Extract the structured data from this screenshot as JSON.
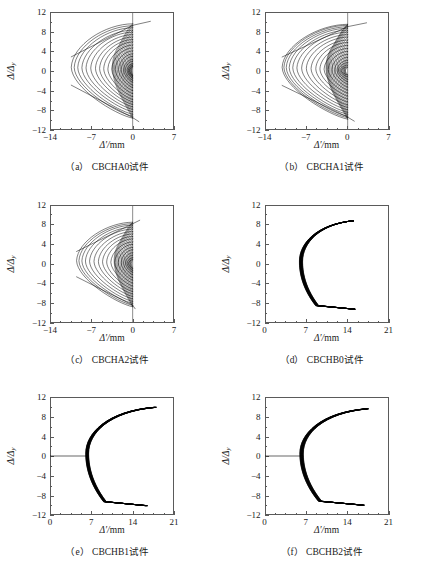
{
  "figure": {
    "background": "#ffffff",
    "axis_color": "#5a5a5a",
    "curve_color": "#000000"
  },
  "chart_data": [
    {
      "id": "a",
      "type": "line",
      "title": "(a) CBCHA0试件",
      "caption_index": "(a)",
      "specimen": "CBCHA0试件",
      "xlabel": "Δ'/mm",
      "ylabel": "Δ/Δy",
      "xlim": [
        -14,
        7
      ],
      "ylim": [
        -12,
        12
      ],
      "xticks": [
        -14,
        -7,
        0,
        7
      ],
      "yticks": [
        12,
        8,
        4,
        0,
        -4,
        -8,
        -12
      ],
      "xminor_count": 3,
      "yminor_count": 1,
      "grid": false,
      "legend": "none",
      "family": "A",
      "direction": "negative",
      "vertex_x": 0.0,
      "loops": [
        {
          "tip_x": -0.55,
          "top_y": 0.9,
          "bot_y": -0.9
        },
        {
          "tip_x": -0.75,
          "top_y": 1.2,
          "bot_y": -1.2
        },
        {
          "tip_x": -0.95,
          "top_y": 1.5,
          "bot_y": -1.5
        },
        {
          "tip_x": -1.25,
          "top_y": 2.0,
          "bot_y": -1.9
        },
        {
          "tip_x": -1.55,
          "top_y": 2.4,
          "bot_y": -2.3
        },
        {
          "tip_x": -1.95,
          "top_y": 3.0,
          "bot_y": -2.9
        },
        {
          "tip_x": -2.4,
          "top_y": 3.5,
          "bot_y": -3.4
        },
        {
          "tip_x": -2.95,
          "top_y": 4.1,
          "bot_y": -4.0
        },
        {
          "tip_x": -3.55,
          "top_y": 4.7,
          "bot_y": -4.6
        },
        {
          "tip_x": -4.2,
          "top_y": 5.3,
          "bot_y": -5.2
        },
        {
          "tip_x": -4.9,
          "top_y": 5.9,
          "bot_y": -5.8
        },
        {
          "tip_x": -5.6,
          "top_y": 6.4,
          "bot_y": -6.3
        },
        {
          "tip_x": -6.3,
          "top_y": 6.9,
          "bot_y": -6.8
        },
        {
          "tip_x": -7.1,
          "top_y": 7.4,
          "bot_y": -7.3
        },
        {
          "tip_x": -7.9,
          "top_y": 7.9,
          "bot_y": -7.8
        },
        {
          "tip_x": -8.6,
          "top_y": 8.3,
          "bot_y": -8.3
        },
        {
          "tip_x": -9.3,
          "top_y": 8.8,
          "bot_y": -8.8
        },
        {
          "tip_x": -9.9,
          "top_y": 9.2,
          "bot_y": -9.2
        },
        {
          "tip_x": -10.4,
          "top_y": 9.6,
          "bot_y": -9.6
        }
      ],
      "overshoot": {
        "x": 3.0,
        "y_top": 10.1,
        "y_bot": -10.3
      }
    },
    {
      "id": "b",
      "type": "line",
      "title": "(b) CBCHA1试件",
      "caption_index": "(b)",
      "specimen": "CBCHA1试件",
      "xlabel": "Δ'/mm",
      "ylabel": "Δ/Δy",
      "xlim": [
        -14,
        7
      ],
      "ylim": [
        -12,
        12
      ],
      "xticks": [
        -14,
        -7,
        0,
        7
      ],
      "yticks": [
        12,
        8,
        4,
        0,
        -4,
        -8,
        -12
      ],
      "xminor_count": 3,
      "yminor_count": 1,
      "grid": false,
      "legend": "none",
      "family": "A",
      "direction": "negative",
      "vertex_x": 0.0,
      "loops": [
        {
          "tip_x": -1.1,
          "top_y": 0.8,
          "bot_y": -0.8
        },
        {
          "tip_x": -1.3,
          "top_y": 1.2,
          "bot_y": -1.2
        },
        {
          "tip_x": -1.55,
          "top_y": 1.7,
          "bot_y": -1.7
        },
        {
          "tip_x": -1.8,
          "top_y": 2.2,
          "bot_y": -2.2
        },
        {
          "tip_x": -2.2,
          "top_y": 2.8,
          "bot_y": -2.7
        },
        {
          "tip_x": -2.7,
          "top_y": 3.4,
          "bot_y": -3.3
        },
        {
          "tip_x": -3.3,
          "top_y": 4.0,
          "bot_y": -3.9
        },
        {
          "tip_x": -4.0,
          "top_y": 4.6,
          "bot_y": -4.5
        },
        {
          "tip_x": -4.7,
          "top_y": 5.2,
          "bot_y": -5.1
        },
        {
          "tip_x": -5.4,
          "top_y": 5.8,
          "bot_y": -5.7
        },
        {
          "tip_x": -6.2,
          "top_y": 6.3,
          "bot_y": -6.3
        },
        {
          "tip_x": -7.0,
          "top_y": 6.9,
          "bot_y": -6.9
        },
        {
          "tip_x": -7.8,
          "top_y": 7.4,
          "bot_y": -7.4
        },
        {
          "tip_x": -8.6,
          "top_y": 7.9,
          "bot_y": -7.9
        },
        {
          "tip_x": -9.3,
          "top_y": 8.3,
          "bot_y": -8.4
        },
        {
          "tip_x": -9.9,
          "top_y": 8.7,
          "bot_y": -8.8
        },
        {
          "tip_x": -10.4,
          "top_y": 9.0,
          "bot_y": -9.2
        },
        {
          "tip_x": -10.8,
          "top_y": 9.3,
          "bot_y": -9.5
        },
        {
          "tip_x": -11.1,
          "top_y": 9.5,
          "bot_y": -9.8
        }
      ],
      "overshoot": {
        "x": 3.2,
        "y_top": 9.8,
        "y_bot": -10.2
      }
    },
    {
      "id": "c",
      "type": "line",
      "title": "(c) CBCHA2试件",
      "caption_index": "(c)",
      "specimen": "CBCHA2试件",
      "xlabel": "Δ'/mm",
      "ylabel": "Δ/Δy",
      "xlim": [
        -14,
        7
      ],
      "ylim": [
        -12,
        12
      ],
      "xticks": [
        -14,
        -7,
        0,
        7
      ],
      "yticks": [
        12,
        8,
        4,
        0,
        -4,
        -8,
        -12
      ],
      "xminor_count": 3,
      "yminor_count": 1,
      "grid": false,
      "legend": "none",
      "family": "A",
      "direction": "negative",
      "vertex_x": 0.0,
      "loops": [
        {
          "tip_x": -0.7,
          "top_y": 0.9,
          "bot_y": -0.9
        },
        {
          "tip_x": -0.95,
          "top_y": 1.3,
          "bot_y": -1.3
        },
        {
          "tip_x": -1.2,
          "top_y": 1.8,
          "bot_y": -1.7
        },
        {
          "tip_x": -1.55,
          "top_y": 2.3,
          "bot_y": -2.2
        },
        {
          "tip_x": -1.95,
          "top_y": 2.9,
          "bot_y": -2.8
        },
        {
          "tip_x": -2.45,
          "top_y": 3.4,
          "bot_y": -3.3
        },
        {
          "tip_x": -3.05,
          "top_y": 4.0,
          "bot_y": -3.9
        },
        {
          "tip_x": -3.7,
          "top_y": 4.5,
          "bot_y": -4.5
        },
        {
          "tip_x": -4.4,
          "top_y": 5.1,
          "bot_y": -5.1
        },
        {
          "tip_x": -5.1,
          "top_y": 5.6,
          "bot_y": -5.6
        },
        {
          "tip_x": -5.8,
          "top_y": 6.1,
          "bot_y": -6.1
        },
        {
          "tip_x": -6.55,
          "top_y": 6.6,
          "bot_y": -6.6
        },
        {
          "tip_x": -7.3,
          "top_y": 7.1,
          "bot_y": -7.1
        },
        {
          "tip_x": -8.0,
          "top_y": 7.5,
          "bot_y": -7.6
        },
        {
          "tip_x": -8.6,
          "top_y": 7.9,
          "bot_y": -8.0
        },
        {
          "tip_x": -9.1,
          "top_y": 8.2,
          "bot_y": -8.4
        },
        {
          "tip_x": -9.5,
          "top_y": 8.5,
          "bot_y": -8.7
        }
      ],
      "overshoot": {
        "x": 1.2,
        "y_top": 8.9,
        "y_bot": -9.1
      }
    },
    {
      "id": "d",
      "type": "line",
      "title": "(d) CBCHB0试件",
      "caption_index": "(d)",
      "specimen": "CBCHB0试件",
      "xlabel": "Δ'/mm",
      "ylabel": "Δ/Δy",
      "xlim": [
        0,
        21
      ],
      "ylim": [
        -12,
        12
      ],
      "xticks": [
        0,
        7,
        14,
        21
      ],
      "yticks": [
        12,
        8,
        4,
        0,
        -4,
        -8,
        -12
      ],
      "xminor_count": 3,
      "yminor_count": 1,
      "grid": false,
      "legend": "none",
      "family": "B",
      "direction": "positive",
      "vertex_x": 6.1,
      "has_zero_tail": false,
      "band": {
        "vertex_x": 6.1,
        "tip_top": {
          "x": 15.0,
          "y": 8.8
        },
        "tip_bot": {
          "x": 15.2,
          "y": -9.2
        },
        "thickness": 0.55,
        "spread": 0.0
      },
      "loops": [],
      "overshoot": null
    },
    {
      "id": "e",
      "type": "line",
      "title": "(e) CBCHB1试件",
      "caption_index": "(e)",
      "specimen": "CBCHB1试件",
      "xlabel": "Δ'/mm",
      "ylabel": "Δ/Δy",
      "xlim": [
        0,
        21
      ],
      "ylim": [
        -12,
        12
      ],
      "xticks": [
        0,
        7,
        14,
        21
      ],
      "yticks": [
        12,
        8,
        4,
        0,
        -4,
        -8,
        -12
      ],
      "xminor_count": 3,
      "yminor_count": 1,
      "grid": false,
      "legend": "none",
      "family": "B",
      "direction": "positive",
      "vertex_x": 6.3,
      "has_zero_tail": true,
      "band": {
        "vertex_x": 6.3,
        "tip_top": {
          "x": 17.8,
          "y": 9.9
        },
        "tip_bot": {
          "x": 16.3,
          "y": -10.1
        },
        "thickness": 0.5,
        "spread": 0.45
      },
      "loops": [],
      "overshoot": null
    },
    {
      "id": "f",
      "type": "line",
      "title": "(f) CBCHB2试件",
      "caption_index": "(f)",
      "specimen": "CBCHB2试件",
      "xlabel": "Δ'/mm",
      "ylabel": "Δ/Δy",
      "xlim": [
        0,
        21
      ],
      "ylim": [
        -12,
        12
      ],
      "xticks": [
        0,
        7,
        14,
        21
      ],
      "yticks": [
        12,
        8,
        4,
        0,
        -4,
        -8,
        -12
      ],
      "xminor_count": 3,
      "yminor_count": 1,
      "grid": false,
      "legend": "none",
      "family": "B",
      "direction": "positive",
      "vertex_x": 6.2,
      "has_zero_tail": true,
      "band": {
        "vertex_x": 6.2,
        "tip_top": {
          "x": 17.3,
          "y": 9.6
        },
        "tip_bot": {
          "x": 16.6,
          "y": -10.0
        },
        "thickness": 0.6,
        "spread": 0.5
      },
      "loops": [],
      "overshoot": null
    }
  ]
}
